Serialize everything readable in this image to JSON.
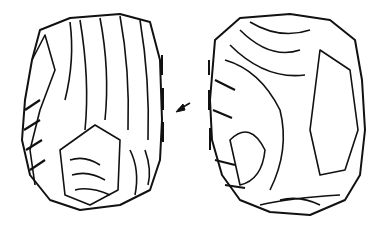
{
  "figure": {
    "views": [
      {
        "name": "left-view"
      },
      {
        "name": "right-view"
      }
    ],
    "annotations": {
      "arrow": "striking direction arrow",
      "dashed_lines": "profile/edge indicators"
    },
    "colors": {
      "ink": "#111111",
      "background": "#ffffff"
    }
  }
}
